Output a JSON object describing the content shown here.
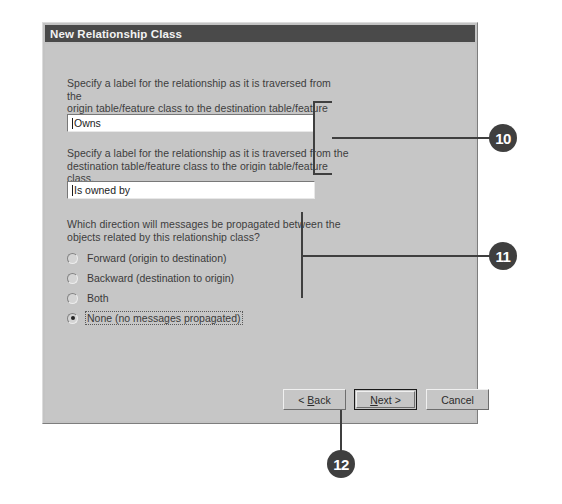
{
  "dialog": {
    "title": "New Relationship Class",
    "forward_label_prompt": "Specify a label for the relationship as it is traversed from the\norigin table/feature class to the destination table/feature class.",
    "forward_label_value": "Owns",
    "backward_label_prompt": "Specify a label for the relationship as it is traversed from the\ndestination table/feature class to the origin table/feature class.",
    "backward_label_value": "Is owned by",
    "message_direction_prompt": "Which direction will messages be propagated between the\nobjects related by this relationship class?",
    "message_direction_options": [
      {
        "label": "Forward (origin to destination)",
        "selected": false,
        "focused": false
      },
      {
        "label": "Backward (destination to origin)",
        "selected": false,
        "focused": false
      },
      {
        "label": "Both",
        "selected": false,
        "focused": false
      },
      {
        "label": "None (no messages propagated)",
        "selected": true,
        "focused": true
      }
    ],
    "buttons": {
      "back": {
        "prefix": "< ",
        "accel": "B",
        "rest": "ack"
      },
      "next": {
        "prefix": "",
        "accel": "N",
        "rest": "ext >"
      },
      "cancel": {
        "prefix": "",
        "accel": "",
        "rest": "Cancel"
      }
    }
  },
  "callouts": [
    {
      "number": "10"
    },
    {
      "number": "11"
    },
    {
      "number": "12"
    }
  ]
}
